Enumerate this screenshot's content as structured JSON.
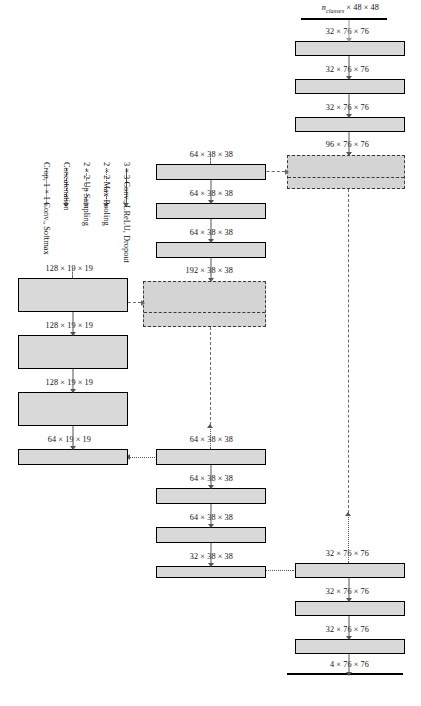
{
  "figure": {
    "colors": {
      "layer_fill": "#d9d9d9",
      "layer_border": "#000000",
      "concat_fill": "#d4d4d4",
      "concat_border": "#3a3a3a",
      "conv_arrow": "#555555",
      "pool_arrow": "#555555",
      "upsample_arrow": "#6a6a6a",
      "concat_arrow": "#6a6a6a",
      "softmax_arrow": "#9a9a9a"
    }
  },
  "legend": {
    "items": [
      {
        "id": "conv",
        "label": "3 × 3 Conv., LReLU, Dropout",
        "style": "solid",
        "color": "#555555",
        "icon": "arrow-up-solid-icon"
      },
      {
        "id": "pool",
        "label": "2 × 2 Max-Pooling",
        "style": "dotted",
        "color": "#555555",
        "icon": "arrow-up-dotted-icon"
      },
      {
        "id": "up",
        "label": "2 × 2 Up Sampling",
        "style": "dashdot",
        "color": "#6a6a6a",
        "icon": "arrow-up-dashdot-icon"
      },
      {
        "id": "concat",
        "label": "Concatenation",
        "style": "dashed",
        "color": "#6a6a6a",
        "icon": "arrow-up-dashed-icon"
      },
      {
        "id": "softmax",
        "label": "Crop, 1 × 1 Conv., Softmax",
        "style": "solid",
        "color": "#9a9a9a",
        "icon": "arrow-up-light-icon"
      }
    ]
  },
  "labels": {
    "output": "n_classes × 48 × 48",
    "output_prefix": "n",
    "output_sub": "classes",
    "output_suffix": " × 48 × 48",
    "input": "4 × 76 × 76",
    "enc_l1_a": "32 × 76 × 76",
    "enc_l1_b": "32 × 76 × 76",
    "enc_l1_c": "32 × 76 × 76",
    "enc_l2_skip": "32 × 38 × 38",
    "enc_l2_a": "64 × 38 × 38",
    "enc_l2_b": "64 × 38 × 38",
    "enc_l2_c": "64 × 38 × 38",
    "bottom_in": "64 × 19 × 19",
    "bottom_a": "128 × 19 × 19",
    "bottom_b": "128 × 19 × 19",
    "bottom_c": "128 × 19 × 19",
    "dec_l2_concat": "192 × 38 × 38",
    "dec_l2_a": "64 × 38 × 38",
    "dec_l2_b": "64 × 38 × 38",
    "dec_l2_c": "64 × 38 × 38",
    "dec_l1_concat": "96 × 76 × 76",
    "dec_l1_a": "32 × 76 × 76",
    "dec_l1_b": "32 × 76 × 76",
    "dec_l1_c": "32 × 76 × 76"
  },
  "blocks": {
    "encoder_level1": [
      {
        "id": "enc1-conv1",
        "label": "32 × 76 × 76"
      },
      {
        "id": "enc1-conv2",
        "label": "32 × 76 × 76"
      },
      {
        "id": "enc1-conv3",
        "label": "32 × 76 × 76"
      }
    ],
    "encoder_level2": [
      {
        "id": "enc2-conv1",
        "label": "64 × 38 × 38"
      },
      {
        "id": "enc2-conv2",
        "label": "64 × 38 × 38"
      },
      {
        "id": "enc2-conv3",
        "label": "64 × 38 × 38"
      }
    ],
    "bottleneck": [
      {
        "id": "bott-conv1",
        "label": "128 × 19 × 19"
      },
      {
        "id": "bott-conv2",
        "label": "128 × 19 × 19"
      },
      {
        "id": "bott-conv3",
        "label": "128 × 19 × 19"
      }
    ],
    "decoder_level2": [
      {
        "id": "dec2-conv1",
        "label": "64 × 38 × 38"
      },
      {
        "id": "dec2-conv2",
        "label": "64 × 38 × 38"
      },
      {
        "id": "dec2-conv3",
        "label": "64 × 38 × 38"
      }
    ],
    "decoder_level1": [
      {
        "id": "dec1-conv1",
        "label": "32 × 76 × 76"
      },
      {
        "id": "dec1-conv2",
        "label": "32 × 76 × 76"
      },
      {
        "id": "dec1-conv3",
        "label": "32 × 76 × 76"
      }
    ],
    "concats": [
      {
        "id": "concat-level2",
        "label": "192 × 38 × 38"
      },
      {
        "id": "concat-level1",
        "label": "96 × 76 × 76"
      }
    ]
  }
}
